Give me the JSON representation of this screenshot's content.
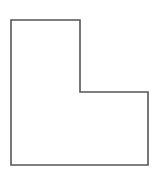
{
  "diagram": {
    "shape": "L-shape",
    "stroke_color": "#555555",
    "fill_color": "#ffffff",
    "stroke_width": 1.6,
    "points": [
      [
        11,
        20
      ],
      [
        80,
        20
      ],
      [
        80,
        92
      ],
      [
        148,
        92
      ],
      [
        148,
        165
      ],
      [
        11,
        165
      ]
    ]
  }
}
